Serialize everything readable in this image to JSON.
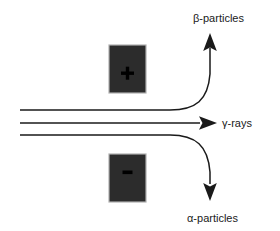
{
  "diagram": {
    "background_color": "#ffffff",
    "beam_color": "#1a1a1a",
    "plate_fill_color": "#2c2c2c",
    "plate_edge_color": "#b0b0b0",
    "sign_color": "#000000",
    "plates": [
      {
        "id": "positive-plate",
        "sign": "+",
        "sign_name": "plus-sign",
        "x": 109,
        "y": 45,
        "width": 37,
        "height": 48
      },
      {
        "id": "negative-plate",
        "sign": "−",
        "sign_name": "minus-sign",
        "x": 109,
        "y": 154,
        "width": 37,
        "height": 48
      }
    ],
    "beams": [
      {
        "id": "beta-beam",
        "label": "β-particles",
        "label_x": 193,
        "label_y": 22,
        "direction": "up",
        "path": "M 20,110 L 170,110 C 196,110 208,100 210,74 L 210,48",
        "arrow_tip_x": 210,
        "arrow_tip_y": 34
      },
      {
        "id": "gamma-beam",
        "label": "γ-rays",
        "label_x": 222,
        "label_y": 127,
        "direction": "right",
        "path": "M 20,123 L 200,123",
        "arrow_tip_x": 216,
        "arrow_tip_y": 123
      },
      {
        "id": "alpha-beam",
        "label": "α-particles",
        "label_x": 187,
        "label_y": 222,
        "direction": "down",
        "path": "M 20,135 L 170,135 C 196,135 208,146 210,172 L 210,184",
        "arrow_tip_x": 210,
        "arrow_tip_y": 200
      }
    ]
  }
}
